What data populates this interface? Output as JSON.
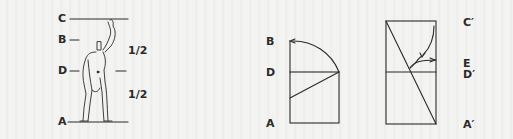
{
  "figure": {
    "left_panel": {
      "labels": {
        "c": "C",
        "b": "B",
        "d": "D",
        "a": "A"
      },
      "ratios": {
        "upper": "1/2",
        "lower": "1/2"
      },
      "subject": "modulor-figure"
    },
    "middle_panel": {
      "labels": {
        "b": "B",
        "d": "D",
        "a": "A"
      }
    },
    "right_panel": {
      "labels": {
        "c_prime": "C′",
        "e": "E",
        "d_prime": "D′",
        "a_prime": "A′"
      }
    },
    "colors": {
      "ink": "#2a2a2a",
      "paper": "#f1f1ef"
    }
  }
}
